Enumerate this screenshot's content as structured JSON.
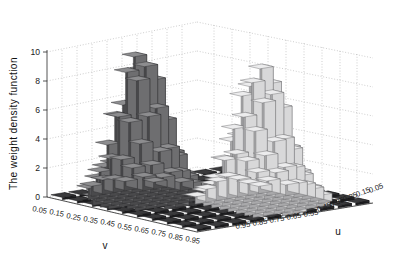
{
  "figure": {
    "type": "3d-bar-plot",
    "background_color": "#ffffff"
  },
  "axes": {
    "z": {
      "title": "The weight density function",
      "ticks": [
        "0",
        "2",
        "4",
        "6",
        "8",
        "10"
      ],
      "values": [
        0,
        2,
        4,
        6,
        8,
        10
      ],
      "range": [
        0,
        10
      ]
    },
    "v": {
      "title": "v",
      "ticks": [
        "0.05",
        "0.15",
        "0.25",
        "0.35",
        "0.45",
        "0.55",
        "0.65",
        "0.75",
        "0.85",
        "0.95"
      ],
      "values": [
        0.05,
        0.15,
        0.25,
        0.35,
        0.45,
        0.55,
        0.65,
        0.75,
        0.85,
        0.95
      ]
    },
    "u": {
      "title": "u",
      "ticks": [
        "0.95",
        "0.85",
        "0.75",
        "0.65",
        "0.55",
        "0.45",
        "0.35",
        "0.25",
        "0.15",
        "0.05"
      ],
      "values": [
        0.95,
        0.85,
        0.75,
        0.65,
        0.55,
        0.45,
        0.35,
        0.25,
        0.15,
        0.05
      ]
    }
  },
  "chart_data": {
    "type": "bar",
    "title": "",
    "xlabel": "v",
    "ylabel": "u",
    "zlabel": "The weight density function",
    "xlim": [
      0.0,
      1.0
    ],
    "ylim": [
      0.0,
      1.0
    ],
    "zlim": [
      0,
      10
    ],
    "grid": true,
    "legend": "none",
    "projection": "3d",
    "x_categories": [
      0.05,
      0.15,
      0.25,
      0.35,
      0.45,
      0.55,
      0.65,
      0.75,
      0.85,
      0.95
    ],
    "y_categories": [
      0.95,
      0.85,
      0.75,
      0.65,
      0.55,
      0.45,
      0.35,
      0.25,
      0.15,
      0.05
    ],
    "peaks": [
      {
        "name": "left-peak",
        "v": 0.45,
        "u": 0.45,
        "height": 9.5,
        "shade": "light"
      },
      {
        "name": "right-peak",
        "v": 0.85,
        "u": 0.25,
        "height": 10.0,
        "shade": "dark"
      }
    ],
    "values": [
      [
        0.1,
        0.15,
        0.2,
        0.3,
        0.35,
        0.4,
        0.35,
        0.3,
        0.2,
        0.1
      ],
      [
        0.2,
        0.5,
        1.1,
        1.8,
        2.2,
        2.1,
        1.6,
        1.0,
        0.5,
        0.2
      ],
      [
        0.35,
        1.2,
        2.6,
        4.2,
        5.1,
        4.6,
        3.2,
        1.8,
        0.9,
        0.3
      ],
      [
        0.5,
        2.1,
        4.6,
        7.2,
        8.4,
        7.6,
        5.2,
        2.9,
        1.3,
        0.4
      ],
      [
        0.55,
        2.4,
        5.4,
        8.6,
        9.5,
        8.4,
        5.9,
        3.2,
        1.5,
        0.45
      ],
      [
        0.45,
        1.9,
        4.2,
        6.8,
        7.6,
        6.9,
        4.8,
        2.6,
        1.2,
        0.4
      ],
      [
        0.35,
        1.1,
        2.4,
        3.8,
        4.4,
        4.1,
        3.0,
        1.7,
        0.8,
        0.3
      ],
      [
        0.25,
        0.6,
        1.2,
        1.9,
        2.3,
        2.2,
        1.7,
        1.0,
        0.5,
        0.2
      ],
      [
        0.15,
        0.3,
        0.55,
        0.85,
        1.0,
        0.95,
        0.75,
        0.45,
        0.25,
        0.12
      ],
      [
        0.08,
        0.12,
        0.2,
        0.3,
        0.35,
        0.33,
        0.26,
        0.16,
        0.1,
        0.06
      ]
    ],
    "values_second_mode": [
      [
        0.1,
        0.2,
        0.4,
        0.6,
        0.7,
        0.6,
        0.4,
        0.2,
        0.1,
        0.05
      ],
      [
        0.2,
        0.6,
        1.4,
        2.4,
        2.9,
        2.5,
        1.6,
        0.8,
        0.3,
        0.1
      ],
      [
        0.4,
        1.5,
        3.5,
        5.8,
        6.8,
        5.9,
        3.8,
        1.8,
        0.7,
        0.2
      ],
      [
        0.55,
        2.4,
        5.8,
        9.2,
        10.0,
        8.8,
        5.6,
        2.6,
        1.0,
        0.3
      ],
      [
        0.5,
        2.2,
        5.2,
        8.4,
        9.2,
        8.1,
        5.1,
        2.4,
        0.9,
        0.28
      ],
      [
        0.4,
        1.5,
        3.4,
        5.5,
        6.2,
        5.5,
        3.5,
        1.7,
        0.65,
        0.2
      ],
      [
        0.28,
        0.8,
        1.8,
        2.9,
        3.3,
        2.95,
        1.9,
        0.95,
        0.4,
        0.14
      ],
      [
        0.18,
        0.4,
        0.85,
        1.35,
        1.55,
        1.4,
        0.92,
        0.48,
        0.22,
        0.1
      ],
      [
        0.1,
        0.2,
        0.38,
        0.58,
        0.66,
        0.6,
        0.4,
        0.22,
        0.12,
        0.06
      ],
      [
        0.06,
        0.1,
        0.16,
        0.24,
        0.28,
        0.26,
        0.18,
        0.11,
        0.07,
        0.04
      ]
    ]
  },
  "colors": {
    "bar_light_top": "#ececed",
    "bar_light_front": "#d8d8d9",
    "bar_light_side": "#a9a9ab",
    "bar_dark_top": "#8d8d8f",
    "bar_dark_front": "#6e6e70",
    "bar_dark_side": "#4a4a4c",
    "bar_floor": "#2b2b2d",
    "grid": "#b9b9b9",
    "axis": "#2a2a2a",
    "text": "#111111"
  }
}
